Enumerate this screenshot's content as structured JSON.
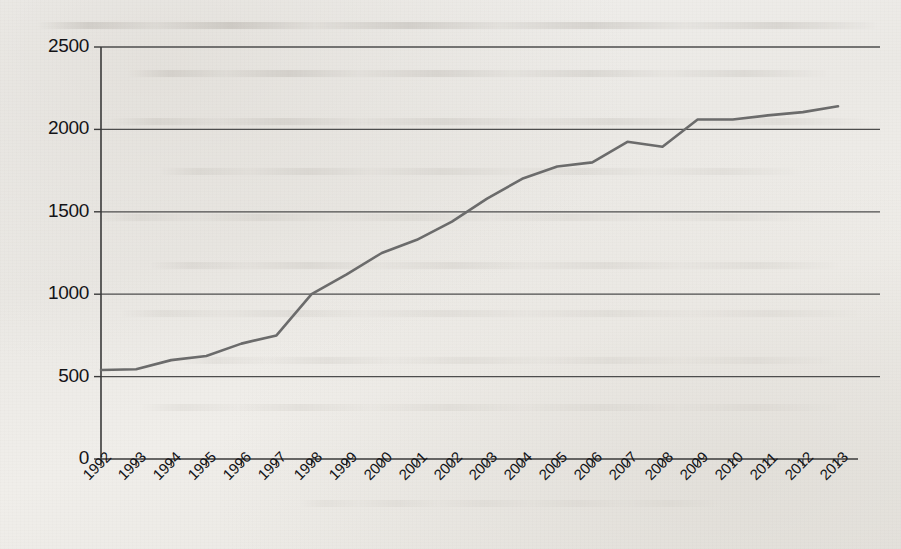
{
  "chart_data": {
    "type": "line",
    "title": "",
    "subtitle": "",
    "xlabel": "",
    "ylabel": "",
    "xlim": [
      1992,
      2013
    ],
    "ylim": [
      0,
      2500
    ],
    "grid": true,
    "legend": false,
    "legend_position": "none",
    "y_ticks": [
      2500,
      2000,
      1500,
      1000,
      500,
      0
    ],
    "categories": [
      "1992",
      "1993",
      "1994",
      "1995",
      "1996",
      "1997",
      "1998",
      "1999",
      "2000",
      "2001",
      "2002",
      "2003",
      "2004",
      "2005",
      "2006",
      "2007",
      "2008",
      "2009",
      "2010",
      "2011",
      "2012",
      "2013"
    ],
    "series": [
      {
        "name": "",
        "color": "#6b6b6b",
        "values": [
          540,
          545,
          600,
          625,
          700,
          750,
          1000,
          1120,
          1250,
          1330,
          1440,
          1580,
          1700,
          1775,
          1800,
          1925,
          1895,
          2060,
          2060,
          2085,
          2105,
          2140
        ]
      }
    ]
  },
  "axis": {
    "y_tick_labels": [
      "2500",
      "2000",
      "1500",
      "1000",
      "500",
      "0"
    ],
    "x_tick_labels": [
      "1992",
      "1993",
      "1994",
      "1995",
      "1996",
      "1997",
      "1998",
      "1999",
      "2000",
      "2001",
      "2002",
      "2003",
      "2004",
      "2005",
      "2006",
      "2007",
      "2008",
      "2009",
      "2010",
      "2011",
      "2012",
      "2013"
    ]
  },
  "style": {
    "line_color": "#6b6b6b",
    "grid_color": "#4d4d4d",
    "axis_color": "#3a3a3a",
    "text_color": "#141417",
    "page_background": "#eeecea"
  }
}
